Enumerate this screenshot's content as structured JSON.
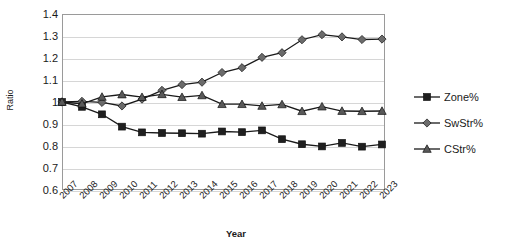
{
  "chart_data": {
    "type": "line",
    "title": "",
    "xlabel": "Year",
    "ylabel": "Ratio",
    "ylim": [
      0.6,
      1.4
    ],
    "ytick_step": 0.1,
    "yticks": [
      "1.4",
      "1.3",
      "1.2",
      "1.1",
      "1",
      "0.9",
      "0.8",
      "0.7",
      "0.6"
    ],
    "grid": true,
    "legend_position": "right",
    "categories": [
      "2007",
      "2008",
      "2009",
      "2010",
      "2011",
      "2012",
      "2013",
      "2014",
      "2015",
      "2016",
      "2017",
      "2018",
      "2019",
      "2020",
      "2021",
      "2022",
      "2023"
    ],
    "series": [
      {
        "name": "Zone%",
        "marker": "square",
        "color": "#1f1f1f",
        "values": [
          1.0,
          0.978,
          0.944,
          0.888,
          0.862,
          0.859,
          0.858,
          0.856,
          0.866,
          0.863,
          0.871,
          0.831,
          0.808,
          0.798,
          0.814,
          0.797,
          0.807
        ]
      },
      {
        "name": "SwStr%",
        "marker": "diamond",
        "color": "#6b6b6b",
        "values": [
          1.0,
          1.003,
          0.998,
          0.982,
          1.013,
          1.053,
          1.079,
          1.09,
          1.134,
          1.156,
          1.203,
          1.224,
          1.283,
          1.306,
          1.296,
          1.284,
          1.286
        ]
      },
      {
        "name": "CStr%",
        "marker": "triangle",
        "color": "#595959",
        "values": [
          1.0,
          0.992,
          1.023,
          1.034,
          1.022,
          1.035,
          1.022,
          1.03,
          0.99,
          0.99,
          0.982,
          0.989,
          0.958,
          0.979,
          0.959,
          0.958,
          0.959
        ]
      }
    ]
  },
  "legend": {
    "items": [
      {
        "label": "Zone%"
      },
      {
        "label": "SwStr%"
      },
      {
        "label": "CStr%"
      }
    ]
  },
  "axes": {
    "y_title": "Ratio",
    "x_title": "Year"
  }
}
